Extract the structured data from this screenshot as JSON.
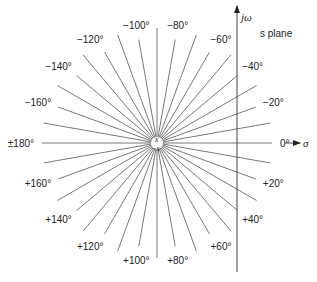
{
  "diagram": {
    "plane_label": "s plane",
    "axis_imag_label": "jω",
    "axis_real_label": "σ",
    "center_labels": {
      "top": "x",
      "bottom": "−s"
    },
    "line_color": "#555555",
    "text_color": "#222222",
    "rays": {
      "step_degrees": 10,
      "labeled": [
        {
          "angle": 0,
          "text": "0°"
        },
        {
          "angle": -20,
          "text": "−20°"
        },
        {
          "angle": -40,
          "text": "−40°"
        },
        {
          "angle": -60,
          "text": "−60°"
        },
        {
          "angle": -80,
          "text": "−80°"
        },
        {
          "angle": -100,
          "text": "−100°"
        },
        {
          "angle": -120,
          "text": "−120°"
        },
        {
          "angle": -140,
          "text": "−140°"
        },
        {
          "angle": -160,
          "text": "−160°"
        },
        {
          "angle": 180,
          "text": "±180°"
        },
        {
          "angle": 160,
          "text": "+160°"
        },
        {
          "angle": 140,
          "text": "+140°"
        },
        {
          "angle": 120,
          "text": "+120°"
        },
        {
          "angle": 100,
          "text": "+100°"
        },
        {
          "angle": 80,
          "text": "+80°"
        },
        {
          "angle": 60,
          "text": "+60°"
        },
        {
          "angle": 40,
          "text": "+40°"
        },
        {
          "angle": 20,
          "text": "+20°"
        }
      ]
    }
  }
}
